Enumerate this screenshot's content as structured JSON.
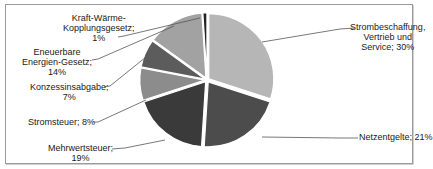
{
  "chart_data": {
    "type": "pie",
    "title": "",
    "categories": [
      "Strombeschaffung, Vertrieb und Service",
      "Netzentgelte",
      "Mehrwertsteuer",
      "Stromsteuer",
      "Konzessinsabgabe",
      "Eneuerbare Energien-Gesetz",
      "Kraft-Wärme-Kopplungsgesetz"
    ],
    "values": [
      30,
      21,
      19,
      8,
      7,
      14,
      1
    ],
    "unit": "%",
    "colors": [
      "#b6b6b6",
      "#4c4c4c",
      "#3a3a3a",
      "#8c8c8c",
      "#5c5c5c",
      "#a2a2a2",
      "#222222"
    ],
    "start_angle_deg": 0,
    "direction": "clockwise",
    "exploded": true,
    "legend": "none (data labels with leader lines)",
    "data_labels": [
      {
        "lines": [
          "Strombeschaffung,",
          "Vertrieb und",
          "Service; 30%"
        ]
      },
      {
        "lines": [
          "Netzentgelte; 21%"
        ]
      },
      {
        "lines": [
          "Mehrwertsteuer;",
          "19%"
        ]
      },
      {
        "lines": [
          "Stromsteuer; 8%"
        ]
      },
      {
        "lines": [
          "Konzessinsabgabe;",
          "7%"
        ]
      },
      {
        "lines": [
          "Eneuerbare",
          "Energien-Gesetz;",
          "14%"
        ]
      },
      {
        "lines": [
          "Kraft-Wärme-",
          "Kopplungsgesetz;",
          "1%"
        ]
      }
    ]
  },
  "labels": {
    "strom": {
      "l1": "Strombeschaffung,",
      "l2": "Vertrieb und",
      "l3": "Service; 30%"
    },
    "netz": {
      "l1": "Netzentgelte; 21%"
    },
    "mwst": {
      "l1": "Mehrwertsteuer;",
      "l2": "19%"
    },
    "stromsteuer": {
      "l1": "Stromsteuer; 8%"
    },
    "konz": {
      "l1": "Konzessinsabgabe;",
      "l2": "7%"
    },
    "eeg": {
      "l1": "Eneuerbare",
      "l2": "Energien-Gesetz;",
      "l3": "14%"
    },
    "kwk": {
      "l1": "Kraft-Wärme-",
      "l2": "Kopplungsgesetz;",
      "l3": "1%"
    }
  }
}
